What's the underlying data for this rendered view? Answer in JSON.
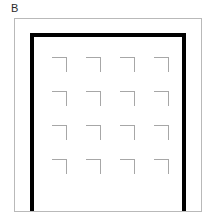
{
  "panel": {
    "label": "B",
    "background_color": "#ffffff"
  },
  "outer_frame": {
    "name": "outer-border-rectangle",
    "stroke_color": "#b9b9b9",
    "stroke_width": 1,
    "x": 14,
    "y": 18,
    "width": 188,
    "height": 194
  },
  "arch_shape": {
    "name": "thick-black-inverted-u",
    "stroke_color": "#000000",
    "stroke_width": 4,
    "left_bar_x": 32,
    "right_bar_x": 184,
    "top_bar_y": 35,
    "bottom_y": 211,
    "description": "inverted-U / gate outline open at the bottom"
  },
  "corner_grid": {
    "name": "corner-bracket-grid",
    "rows": 4,
    "columns": 4,
    "count": 16,
    "mark_glyph": "top-right-corner-bracket",
    "mark_size": 15,
    "stroke_color": "#a7a7a7",
    "stroke_width": 1,
    "origin_x": 52,
    "origin_y": 57,
    "spacing_x": 34,
    "spacing_y": 34,
    "marks": [
      {
        "row": 0,
        "col": 0,
        "x": 52,
        "y": 57
      },
      {
        "row": 0,
        "col": 1,
        "x": 86,
        "y": 57
      },
      {
        "row": 0,
        "col": 2,
        "x": 120,
        "y": 57
      },
      {
        "row": 0,
        "col": 3,
        "x": 154,
        "y": 57
      },
      {
        "row": 1,
        "col": 0,
        "x": 52,
        "y": 91
      },
      {
        "row": 1,
        "col": 1,
        "x": 86,
        "y": 91
      },
      {
        "row": 1,
        "col": 2,
        "x": 120,
        "y": 91
      },
      {
        "row": 1,
        "col": 3,
        "x": 154,
        "y": 91
      },
      {
        "row": 2,
        "col": 0,
        "x": 52,
        "y": 125
      },
      {
        "row": 2,
        "col": 1,
        "x": 86,
        "y": 125
      },
      {
        "row": 2,
        "col": 2,
        "x": 120,
        "y": 125
      },
      {
        "row": 2,
        "col": 3,
        "x": 154,
        "y": 125
      },
      {
        "row": 3,
        "col": 0,
        "x": 52,
        "y": 159
      },
      {
        "row": 3,
        "col": 1,
        "x": 86,
        "y": 159
      },
      {
        "row": 3,
        "col": 2,
        "x": 120,
        "y": 159
      },
      {
        "row": 3,
        "col": 3,
        "x": 154,
        "y": 159
      }
    ]
  }
}
